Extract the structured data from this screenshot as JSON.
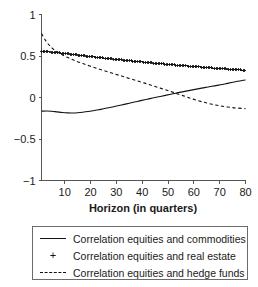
{
  "chart_data": {
    "type": "line",
    "title": "",
    "xlabel": "Horizon (in quarters)",
    "ylabel": "",
    "xlim": [
      1,
      80
    ],
    "ylim": [
      -1,
      1
    ],
    "grid": false,
    "legend_position": "bottom",
    "x_ticks": [
      10,
      20,
      30,
      40,
      50,
      60,
      70,
      80
    ],
    "y_ticks": [
      1,
      0.5,
      0,
      -0.5,
      -1
    ],
    "x_tick_labels": [
      "10",
      "20",
      "30",
      "40",
      "50",
      "60",
      "70",
      "80"
    ],
    "y_tick_labels": [
      "1",
      "0.5",
      "0",
      "−0.5",
      "−1"
    ],
    "x": [
      1,
      3,
      5,
      7,
      9,
      11,
      13,
      15,
      17,
      19,
      21,
      23,
      25,
      27,
      29,
      31,
      33,
      35,
      37,
      39,
      41,
      43,
      45,
      47,
      49,
      51,
      53,
      55,
      57,
      59,
      61,
      63,
      65,
      67,
      69,
      71,
      73,
      75,
      77,
      79,
      80
    ],
    "series": [
      {
        "name": "Correlation equities and commodities",
        "style": "solid",
        "marker": "none",
        "values": [
          -0.165,
          -0.162,
          -0.166,
          -0.173,
          -0.18,
          -0.185,
          -0.186,
          -0.183,
          -0.177,
          -0.169,
          -0.159,
          -0.148,
          -0.136,
          -0.124,
          -0.111,
          -0.097,
          -0.083,
          -0.069,
          -0.055,
          -0.041,
          -0.027,
          -0.014,
          0.0,
          0.013,
          0.026,
          0.039,
          0.052,
          0.065,
          0.077,
          0.089,
          0.101,
          0.113,
          0.124,
          0.135,
          0.146,
          0.157,
          0.17,
          0.183,
          0.196,
          0.207,
          0.212
        ]
      },
      {
        "name": "Correlation equities and real estate",
        "style": "none",
        "marker": "+",
        "values": [
          0.553,
          0.551,
          0.547,
          0.541,
          0.534,
          0.527,
          0.519,
          0.512,
          0.504,
          0.497,
          0.49,
          0.483,
          0.476,
          0.469,
          0.462,
          0.456,
          0.449,
          0.443,
          0.437,
          0.431,
          0.425,
          0.419,
          0.413,
          0.408,
          0.402,
          0.397,
          0.391,
          0.386,
          0.381,
          0.376,
          0.371,
          0.366,
          0.361,
          0.356,
          0.352,
          0.347,
          0.343,
          0.338,
          0.334,
          0.33,
          0.329
        ]
      },
      {
        "name": "Correlation equities and hedge funds",
        "style": "dashed",
        "marker": "none",
        "values": [
          0.77,
          0.668,
          0.599,
          0.551,
          0.514,
          0.484,
          0.457,
          0.432,
          0.409,
          0.387,
          0.366,
          0.346,
          0.326,
          0.306,
          0.287,
          0.268,
          0.249,
          0.23,
          0.211,
          0.192,
          0.173,
          0.153,
          0.133,
          0.113,
          0.093,
          0.072,
          0.051,
          0.03,
          0.009,
          -0.012,
          -0.032,
          -0.05,
          -0.066,
          -0.081,
          -0.094,
          -0.105,
          -0.114,
          -0.122,
          -0.128,
          -0.132,
          -0.134
        ]
      }
    ]
  },
  "legend": {
    "entries": [
      {
        "label": "Correlation equities and commodities",
        "marker": "solid-line-marker"
      },
      {
        "label": "Correlation equities and real estate",
        "marker": "plus-marker"
      },
      {
        "label": "Correlation equities and hedge funds",
        "marker": "dashed-line-marker"
      }
    ]
  }
}
